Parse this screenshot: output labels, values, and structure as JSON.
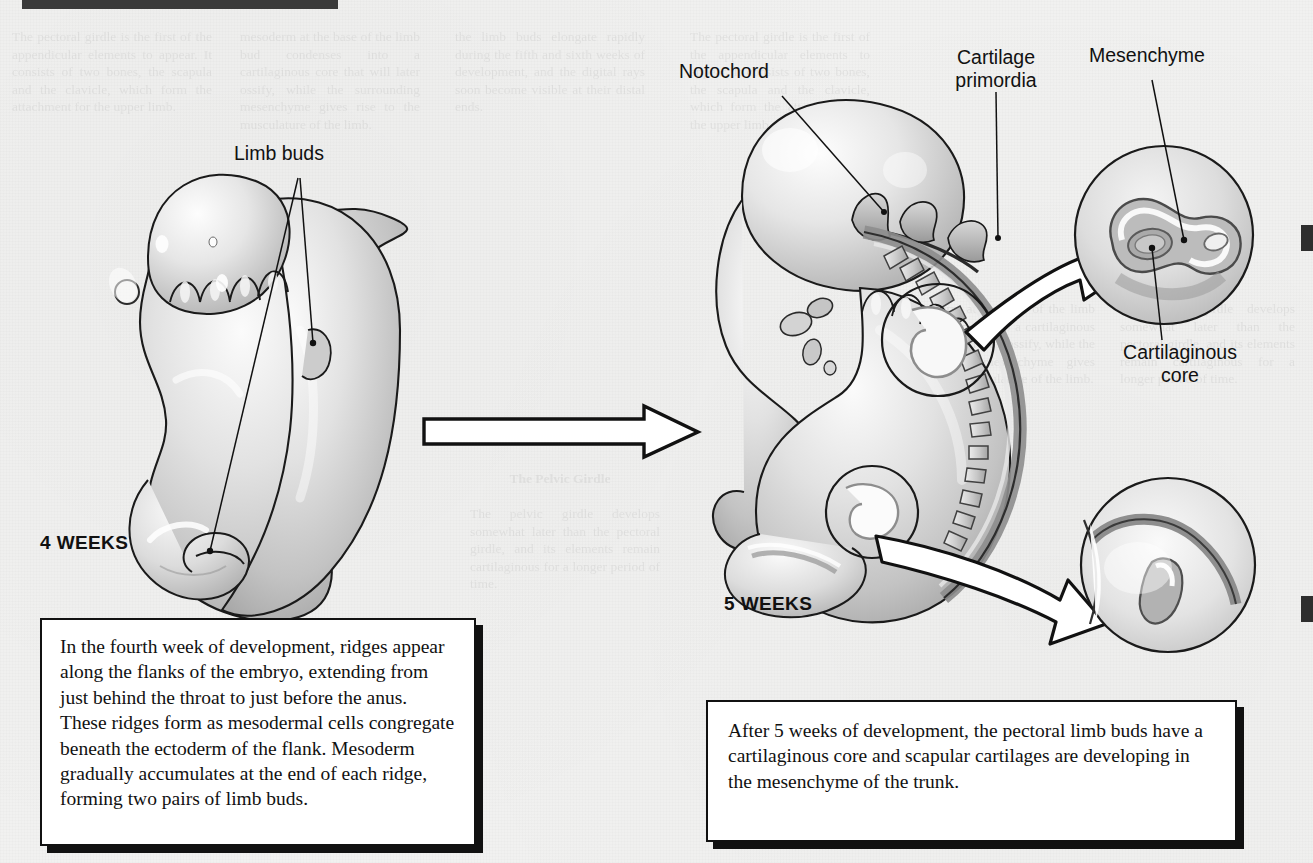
{
  "page": {
    "background_color": "#f1f1f0",
    "ink_color": "#111111",
    "header_bar_color": "#3a3a3a",
    "header_partial_text": "Development of the Appendicular Skeleton"
  },
  "figure": {
    "stage_left": {
      "stage_label": "4 WEEKS",
      "callouts": [
        {
          "name": "limb-buds",
          "text": "Limb buds"
        }
      ]
    },
    "stage_right": {
      "stage_label": "5 WEEKS",
      "callouts": [
        {
          "name": "notochord",
          "text": "Notochord"
        },
        {
          "name": "cartilage-primordia",
          "text": "Cartilage\nprimordia"
        },
        {
          "name": "mesenchyme",
          "text": "Mesenchyme"
        },
        {
          "name": "cartilaginous-core",
          "text": "Cartilaginous\ncore"
        }
      ]
    },
    "transition_arrow": {
      "name": "stage-transition-arrow",
      "direction": "right"
    },
    "magnifier_arrows": [
      {
        "name": "upper-magnifier-arrow",
        "points_to": "mesenchyme-inset"
      },
      {
        "name": "lower-magnifier-arrow",
        "points_to": "cartilaginous-core-inset"
      }
    ],
    "insets": [
      {
        "name": "mesenchyme-inset",
        "position": "top-right"
      },
      {
        "name": "cartilaginous-core-inset",
        "position": "bottom-right"
      }
    ]
  },
  "captions": {
    "left": "In the fourth week of development, ridges appear along the flanks of the embryo, extending from just behind the throat to just before the anus. These ridges form as mesodermal cells congregate beneath the ectoderm of the flank. Mesoderm gradually accumulates at the end of each ridge, forming two pairs of limb buds.",
    "right": "After 5 weeks of development, the pectoral limb buds have a cartilaginous core and scapular cartilages are developing in the mesenchyme of the trunk."
  },
  "ghost_text": {
    "col1": "The pectoral girdle is the first of the appendicular elements to appear. It consists of two bones, the scapula and the clavicle, which form the attachment for the upper limb.",
    "col2": "mesoderm at the base of the limb bud condenses into a cartilaginous core that will later ossify, while the surrounding mesenchyme gives rise to the musculature of the limb.",
    "col3": "the limb buds elongate rapidly during the fifth and sixth weeks of development, and the digital rays soon become visible at their distal ends.",
    "col4": "The Pelvic Girdle",
    "col5": "The pelvic girdle develops somewhat later than the pectoral girdle, and its elements remain cartilaginous for a longer period of time."
  }
}
